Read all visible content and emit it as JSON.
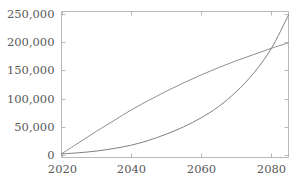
{
  "chart_data": {
    "type": "line",
    "title": "",
    "subtitle": "",
    "xlabel": "",
    "ylabel": "",
    "xlim": [
      2020,
      2085
    ],
    "ylim": [
      0,
      255000
    ],
    "grid": false,
    "legend": null,
    "legend_position": "none",
    "background_color": "#ffffff",
    "frame_color": "#b9b9b9",
    "tick_label_color": "#595959",
    "x_ticks": [
      2020,
      2040,
      2060,
      2080
    ],
    "x_tick_labels": [
      "2020",
      "2040",
      "2060",
      "2080"
    ],
    "y_ticks": [
      0,
      50000,
      100000,
      150000,
      200000,
      250000
    ],
    "y_tick_labels": [
      "0",
      "50,000",
      "100,000",
      "150,000",
      "200,000",
      "250,000"
    ],
    "annotations": [],
    "series": [
      {
        "name": "concave-curve",
        "color": "#8f8f8f",
        "line_width": 1,
        "x": [
          2020,
          2025,
          2030,
          2035,
          2040,
          2045,
          2050,
          2055,
          2060,
          2065,
          2070,
          2075,
          2080,
          2085
        ],
        "values": [
          2000,
          22000,
          42000,
          61000,
          80000,
          97000,
          113000,
          128000,
          142000,
          155000,
          167000,
          178000,
          189000,
          199000
        ]
      },
      {
        "name": "exponential-curve",
        "color": "#808080",
        "line_width": 1,
        "x": [
          2020,
          2025,
          2030,
          2035,
          2040,
          2045,
          2050,
          2055,
          2060,
          2065,
          2070,
          2075,
          2080,
          2085
        ],
        "values": [
          2000,
          4000,
          7000,
          11500,
          17500,
          26000,
          37000,
          50000,
          66000,
          86000,
          112000,
          145000,
          188000,
          248000
        ]
      }
    ],
    "intersection": {
      "x": 2078,
      "y": 186000
    }
  }
}
